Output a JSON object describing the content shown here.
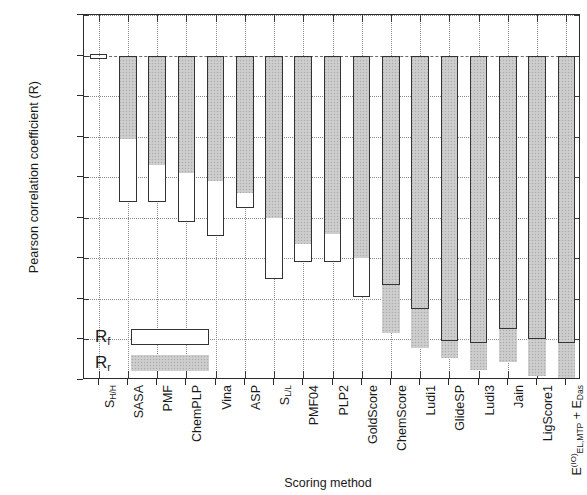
{
  "chart_data": {
    "type": "bar",
    "title": "",
    "xlabel": "Scoring method",
    "ylabel": "Pearson correlation coefficient (R)",
    "ylim": [
      -0.8,
      0.1
    ],
    "yticks": [
      0.1,
      0,
      -0.1,
      -0.2,
      -0.3,
      -0.4,
      -0.5,
      -0.6,
      -0.7,
      -0.8
    ],
    "ytick_labels": [
      "0.1",
      "0",
      "-0.1",
      "-0.2",
      "-0.3",
      "-0.4",
      "-0.5",
      "-0.6",
      "-0.7",
      "-0.8"
    ],
    "grid": true,
    "legend_position": "lower-left-inside",
    "categories": [
      "S_H/H",
      "SASA",
      "PMF",
      "ChemPLP",
      "Vina",
      "ASP",
      "S_L/L",
      "PMF04",
      "PLP2",
      "GoldScore",
      "ChemScore",
      "Ludi1",
      "GlideSP",
      "Ludi3",
      "Jain",
      "LigScore1",
      "E_EL,MTP + E_Das"
    ],
    "series": [
      {
        "name": "Rf",
        "values": [
          0.005,
          -0.36,
          -0.36,
          -0.41,
          -0.445,
          -0.375,
          -0.55,
          -0.51,
          -0.51,
          -0.595,
          -0.565,
          -0.625,
          -0.705,
          -0.71,
          -0.675,
          -0.7,
          -0.71
        ]
      },
      {
        "name": "Rr",
        "values": [
          0.0,
          -0.205,
          -0.27,
          -0.29,
          -0.31,
          -0.34,
          -0.4,
          -0.465,
          -0.44,
          -0.5,
          -0.685,
          -0.72,
          -0.745,
          -0.775,
          -0.755,
          -0.79,
          -0.8
        ]
      }
    ],
    "colors": {
      "rf_outline": "#333333",
      "rf_fill": "#ffffff",
      "rr_fill": "#c9c9c9"
    }
  },
  "axis": {
    "y_title": "Pearson correlation coefficient (R)",
    "x_title": "Scoring method"
  },
  "legend": {
    "entries": [
      {
        "key": "Rf",
        "label_main": "R",
        "label_sub": "f"
      },
      {
        "key": "Rr",
        "label_main": "R",
        "label_sub": "r"
      }
    ]
  },
  "x_labels_rich": [
    {
      "main": "S",
      "sub": "H/H",
      "sup": "",
      "tail": ""
    },
    {
      "main": "SASA",
      "sub": "",
      "sup": "",
      "tail": ""
    },
    {
      "main": "PMF",
      "sub": "",
      "sup": "",
      "tail": ""
    },
    {
      "main": "ChemPLP",
      "sub": "",
      "sup": "",
      "tail": ""
    },
    {
      "main": "Vina",
      "sub": "",
      "sup": "",
      "tail": ""
    },
    {
      "main": "ASP",
      "sub": "",
      "sup": "",
      "tail": ""
    },
    {
      "main": "S",
      "sub": "L/L",
      "sup": "",
      "tail": ""
    },
    {
      "main": "PMF04",
      "sub": "",
      "sup": "",
      "tail": ""
    },
    {
      "main": "PLP2",
      "sub": "",
      "sup": "",
      "tail": ""
    },
    {
      "main": "GoldScore",
      "sub": "",
      "sup": "",
      "tail": ""
    },
    {
      "main": "ChemScore",
      "sub": "",
      "sup": "",
      "tail": ""
    },
    {
      "main": "Ludi1",
      "sub": "",
      "sup": "",
      "tail": ""
    },
    {
      "main": "GlideSP",
      "sub": "",
      "sup": "",
      "tail": ""
    },
    {
      "main": "Ludi3",
      "sub": "",
      "sup": "",
      "tail": ""
    },
    {
      "main": "Jain",
      "sub": "",
      "sup": "",
      "tail": ""
    },
    {
      "main": "LigScore1",
      "sub": "",
      "sup": "",
      "tail": ""
    },
    {
      "main": "E",
      "sub": "EL,MTP",
      "sup": "(IO)",
      "tail": "+ E_Das"
    }
  ]
}
